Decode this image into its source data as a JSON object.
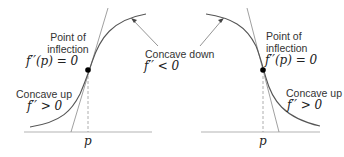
{
  "left_panel": {
    "inflection_label": [
      "Point of",
      "inflection"
    ],
    "inflection_eq": "f′′(p) = 0",
    "concave_up_label": "Concave up",
    "concave_up_eq": "f′′ > 0",
    "concave_down_label": "Concave down",
    "concave_down_eq": "f′′ < 0",
    "axis_label": "p"
  },
  "right_panel": {
    "inflection_label": [
      "Point of",
      "inflection"
    ],
    "inflection_eq": "f′′(p) = 0",
    "concave_up_label": "Concave up",
    "concave_up_eq": "f′′ > 0",
    "axis_label": "p"
  },
  "colors": {
    "curve": "#555555",
    "axis": "#aaaaaa",
    "point": "#000000"
  }
}
